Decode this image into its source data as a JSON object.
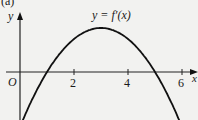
{
  "figure": {
    "part_label": "(a)",
    "curve_label": "y = f′(x)",
    "origin_label": "O",
    "x_axis_label": "x",
    "y_axis_label": "y"
  },
  "chart_data": {
    "type": "line",
    "title": "",
    "part_label": "(a)",
    "xlabel": "x",
    "ylabel": "y",
    "legend": [
      "y = f′(x)"
    ],
    "annotations": [
      "O",
      "y = f′(x)"
    ],
    "x_ticks": [
      2,
      4,
      6
    ],
    "xlim": [
      0,
      6.3
    ],
    "grid": false,
    "series": [
      {
        "name": "y = f′(x)",
        "description": "downward parabola with roots near x=1 and x=5, maximum near x=3",
        "x": [
          0,
          0.5,
          1,
          1.5,
          2,
          2.5,
          3,
          3.5,
          4,
          4.5,
          5,
          5.5,
          6
        ],
        "y": [
          -5,
          -2.25,
          0,
          1.75,
          3,
          3.75,
          4,
          3.75,
          3,
          1.75,
          0,
          -2.25,
          -5
        ]
      }
    ],
    "roots": [
      1,
      5
    ],
    "maximum": {
      "x": 3,
      "y": 4
    }
  }
}
